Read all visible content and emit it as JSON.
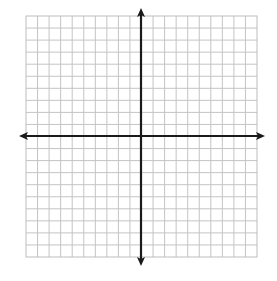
{
  "diagram": {
    "type": "coordinate-plane",
    "grid": {
      "columns": 20,
      "rows": 20,
      "left": 26,
      "top": 16,
      "right": 257,
      "bottom": 257,
      "line_color": "#c4c4c4",
      "border_color": "#bdbdbd"
    },
    "axes": {
      "x_axis_y": 136,
      "y_axis_x": 141,
      "x_axis_extent": [
        19,
        265
      ],
      "y_axis_extent": [
        8,
        266
      ],
      "color": "#1a1a1a",
      "width": 2.2,
      "arrowheads": [
        "left",
        "right",
        "up",
        "down"
      ]
    },
    "labels": {
      "x_axis": "x-axis",
      "y_axis": "y-axis"
    },
    "background": "#ffffff"
  }
}
